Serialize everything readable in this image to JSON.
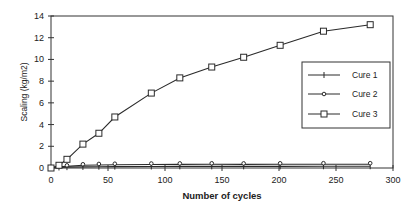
{
  "chart_data": {
    "type": "line",
    "title": "",
    "xlabel": "Number of cycles",
    "ylabel": "Scaling (kg/m2)",
    "xlim": [
      0,
      300
    ],
    "ylim": [
      0,
      14
    ],
    "xticks": [
      0,
      50,
      100,
      150,
      200,
      250,
      300
    ],
    "yticks": [
      0,
      2,
      4,
      6,
      8,
      10,
      12,
      14
    ],
    "grid": false,
    "legend_position": "right-center inside plot",
    "series": [
      {
        "name": "Cure 1",
        "marker": "plus",
        "x": [
          0,
          7,
          14,
          28,
          42,
          56,
          88,
          113,
          141,
          169,
          201,
          239,
          280
        ],
        "y": [
          0,
          0.05,
          0.08,
          0.1,
          0.12,
          0.13,
          0.14,
          0.15,
          0.15,
          0.15,
          0.15,
          0.16,
          0.16
        ]
      },
      {
        "name": "Cure 2",
        "marker": "diamond",
        "x": [
          0,
          7,
          14,
          28,
          42,
          56,
          88,
          113,
          141,
          169,
          201,
          239,
          280
        ],
        "y": [
          0,
          0.1,
          0.15,
          0.25,
          0.28,
          0.3,
          0.32,
          0.33,
          0.34,
          0.33,
          0.34,
          0.35,
          0.35
        ]
      },
      {
        "name": "Cure 3",
        "marker": "square",
        "x": [
          0,
          7,
          14,
          28,
          42,
          56,
          88,
          113,
          141,
          169,
          201,
          239,
          280
        ],
        "y": [
          0,
          0.25,
          0.8,
          2.2,
          3.2,
          4.7,
          6.9,
          8.3,
          9.3,
          10.2,
          11.3,
          12.6,
          13.2
        ]
      }
    ]
  },
  "legend": {
    "items": [
      {
        "label": "Cure 1"
      },
      {
        "label": "Cure 2"
      },
      {
        "label": "Cure 3"
      }
    ]
  },
  "colors": {
    "line": "#2a2a2a",
    "axis": "#333333"
  }
}
